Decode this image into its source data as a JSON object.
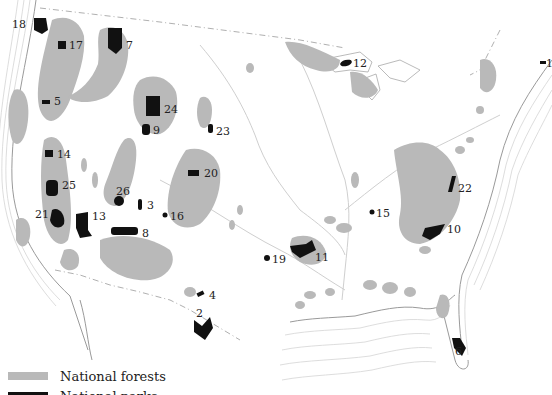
{
  "map": {
    "title": "National forests and national parks of the United States",
    "colors": {
      "forest": "#b9b9b9",
      "park": "#111111",
      "background": "#ffffff"
    },
    "parks": [
      {
        "id": "1",
        "x": 546,
        "y": 62
      },
      {
        "id": "2",
        "x": 196,
        "y": 320
      },
      {
        "id": "3",
        "x": 147,
        "y": 204
      },
      {
        "id": "4",
        "x": 209,
        "y": 296
      },
      {
        "id": "5",
        "x": 54,
        "y": 100
      },
      {
        "id": "6",
        "x": 453,
        "y": 345
      },
      {
        "id": "7",
        "x": 124,
        "y": 40
      },
      {
        "id": "8",
        "x": 142,
        "y": 232
      },
      {
        "id": "9",
        "x": 153,
        "y": 129
      },
      {
        "id": "10",
        "x": 445,
        "y": 229
      },
      {
        "id": "11",
        "x": 315,
        "y": 252
      },
      {
        "id": "12",
        "x": 351,
        "y": 60
      },
      {
        "id": "13",
        "x": 92,
        "y": 214
      },
      {
        "id": "14",
        "x": 57,
        "y": 153
      },
      {
        "id": "15",
        "x": 376,
        "y": 213
      },
      {
        "id": "16",
        "x": 171,
        "y": 215
      },
      {
        "id": "17",
        "x": 69,
        "y": 44
      },
      {
        "id": "18",
        "x": 12,
        "y": 22
      },
      {
        "id": "19",
        "x": 271,
        "y": 259
      },
      {
        "id": "20",
        "x": 204,
        "y": 173
      },
      {
        "id": "21",
        "x": 33,
        "y": 214
      },
      {
        "id": "22",
        "x": 457,
        "y": 187
      },
      {
        "id": "23",
        "x": 216,
        "y": 130
      },
      {
        "id": "24",
        "x": 164,
        "y": 108
      },
      {
        "id": "25",
        "x": 62,
        "y": 184
      },
      {
        "id": "26",
        "x": 116,
        "y": 190
      }
    ]
  },
  "legend": {
    "items": [
      {
        "label": "National forests",
        "color": "#b9b9b9"
      },
      {
        "label": "National parks",
        "color": "#111111"
      }
    ]
  }
}
